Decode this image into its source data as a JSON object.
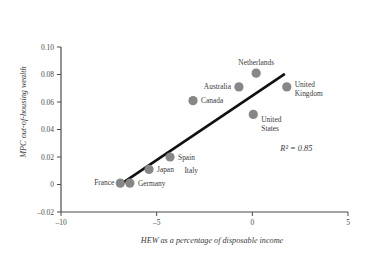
{
  "chart_data": {
    "type": "scatter",
    "title": "",
    "xlabel": "HEW as a percentage of disposable income",
    "ylabel": "MPC out-of-housing wealth",
    "xlim": [
      -10,
      5
    ],
    "ylim": [
      -0.02,
      0.1
    ],
    "xticks": [
      -10,
      -5,
      0,
      5
    ],
    "xtick_labels": [
      "–10",
      "–5",
      "0",
      "5"
    ],
    "yticks": [
      -0.02,
      0,
      0.02,
      0.04,
      0.06,
      0.08,
      0.1
    ],
    "ytick_labels": [
      "–0.02",
      "0",
      "0.02",
      "0.04",
      "0.06",
      "0.08",
      "0.10"
    ],
    "grid": false,
    "legend": "none",
    "marker_color": "#878787",
    "marker_radius": 4.6,
    "line_color": "#111111",
    "line_width": 2.6,
    "points": [
      {
        "label": "France",
        "x": -6.9,
        "y": 0.001,
        "label_dx": -6,
        "label_dy": 2,
        "label_anchor": "end"
      },
      {
        "label": "Germany",
        "x": -6.4,
        "y": 0.001,
        "label_dx": 8,
        "label_dy": 3,
        "label_anchor": "start"
      },
      {
        "label": "Japan",
        "x": -5.4,
        "y": 0.011,
        "label_dx": 8,
        "label_dy": 3,
        "label_anchor": "start"
      },
      {
        "label": "Spain",
        "x": -4.3,
        "y": 0.02,
        "label_dx": 8,
        "label_dy": 2.5,
        "label_anchor": "start"
      },
      {
        "label": "Canada",
        "x": -3.1,
        "y": 0.061,
        "label_dx": 8,
        "label_dy": 2.5,
        "label_anchor": "start"
      },
      {
        "label": "Australia",
        "x": -0.7,
        "y": 0.071,
        "label_dx": -8,
        "label_dy": 2.5,
        "label_anchor": "end"
      },
      {
        "label": "Netherlands",
        "x": 0.2,
        "y": 0.081,
        "label_dx": 0,
        "label_dy": -8,
        "label_anchor": "middle"
      },
      {
        "label": "United\nStates",
        "x": 0.05,
        "y": 0.051,
        "label_dx": 8,
        "label_dy": 8,
        "label_anchor": "start"
      },
      {
        "label": "United\nKingdom",
        "x": 1.8,
        "y": 0.071,
        "label_dx": 8,
        "label_dy": 0,
        "label_anchor": "start"
      }
    ],
    "extra_labels": [
      {
        "text": "Italy",
        "x": -3.55,
        "y": 0.0105
      }
    ],
    "trendline": {
      "x1": -6.85,
      "y1": 0.0005,
      "x2": 1.7,
      "y2": 0.0805
    },
    "annotations": [
      {
        "text": "R² = 0.85",
        "x": 2.3,
        "y": 0.0245
      }
    ]
  }
}
